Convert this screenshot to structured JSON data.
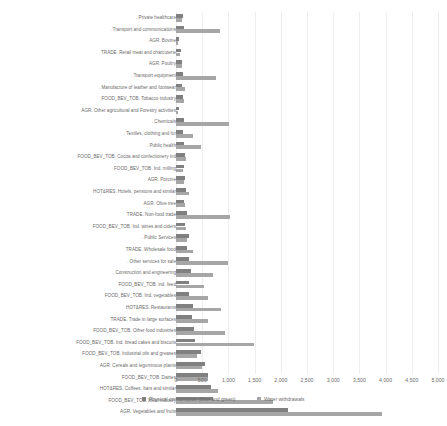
{
  "chart_data": {
    "type": "bar",
    "orientation": "horizontal",
    "title": "",
    "xlabel": "",
    "ylabel": "",
    "xlim": [
      0,
      5000
    ],
    "xticks": [
      0,
      500,
      1000,
      1500,
      2000,
      2500,
      3000,
      3500,
      4000,
      4500,
      5000
    ],
    "xtick_labels": [
      "0",
      "500",
      "1,000",
      "1,500",
      "2,000",
      "2,500",
      "3,000",
      "3,500",
      "4,000",
      "4,500",
      "5,000"
    ],
    "grid": true,
    "legend_position": "bottom",
    "colors": {
      "physical_consumption": "#808080",
      "water_withdrawals": "#a6a6a6",
      "gridline": "#eceff1",
      "text": "#6b6b6b"
    },
    "categories": [
      ". Private healthcare",
      ". Transport and communications",
      "AGR. Bovine",
      "TRADE. Retail meat and charcuterie",
      "AGR. Poultry",
      ". Transport equipment",
      ". Manufacture of leather and footwear",
      "FOOD_BEV_TOB. Tobacco industry",
      "AGR. Other agricultural and Forestry activities",
      ". Chemicals",
      ". Textiles, clothing and fur",
      ". Public health",
      "FOOD_BEV_TOB. Cocoa and confectionery ind",
      "FOOD_BEV_TOB. Ind. milling",
      "AGR. Porcine",
      "HOT&RES. Hotels, pensions and similar",
      "AGR. Olive tree",
      "TRADE. Non-food trade",
      "FOOD_BEV_TOB. Ind. wines and ciders",
      ". Public Services",
      "TRADE. Wholesale food",
      ". Other services for sale",
      ". Construction and engineering",
      "FOOD_BEV_TOB. ind. feed",
      "FOOD_BEV_TOB. Ind. vegetables",
      "HOT&RES. Restaurants",
      "TRADE. Trade in large surfaces",
      "FOOD_BEV_TOB. Other food industries",
      "FOOD_BEV_TOB. Ind. bread cakes and biscuits",
      "FOOD_BEV_TOB. Industrial oils and greases",
      "AGR. Cereals and leguminous plants",
      "FOOD_BEV_TOB. Dairies",
      "HOT&RES. Coffees, bars and similar",
      "FOOD_BEV_TOB. Meat industry",
      "AGR. Vegetables and fruits"
    ],
    "series": [
      {
        "name": "Physical consumption (blue and green)",
        "color": "#808080",
        "values": [
          130,
          150,
          60,
          95,
          105,
          140,
          120,
          125,
          55,
          150,
          140,
          145,
          165,
          150,
          170,
          185,
          160,
          215,
          175,
          240,
          215,
          240,
          290,
          245,
          250,
          320,
          300,
          345,
          360,
          470,
          555,
          620,
          660,
          700,
          2140
        ]
      },
      {
        "name": "Water withdrawals",
        "color": "#a6a6a6",
        "values": [
          120,
          840,
          30,
          70,
          110,
          755,
          170,
          160,
          35,
          1010,
          330,
          470,
          200,
          130,
          155,
          245,
          180,
          1025,
          195,
          215,
          330,
          1000,
          700,
          540,
          620,
          860,
          605,
          930,
          1480,
          410,
          490,
          610,
          800,
          1860,
          3930
        ]
      }
    ]
  },
  "legend": {
    "items": [
      {
        "label": "Physical consumption (blue and green)",
        "swatch": "legend-swatch-consumption"
      },
      {
        "label": "Water withdrawals",
        "swatch": "legend-swatch-withdrawals"
      }
    ]
  }
}
